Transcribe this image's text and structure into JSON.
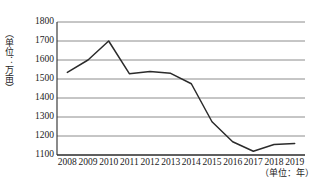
{
  "chart_data": {
    "type": "line",
    "title": "",
    "subtitle": "",
    "xlabel": "（单位：年）",
    "ylabel": "（单位：万亩）",
    "categories": [
      "2008",
      "2009",
      "2010",
      "2011",
      "2012",
      "2013",
      "2014",
      "2015",
      "2016",
      "2017",
      "2018",
      "2019"
    ],
    "x": [
      2008,
      2009,
      2010,
      2011,
      2012,
      2013,
      2014,
      2015,
      2016,
      2017,
      2018,
      2019
    ],
    "values": [
      1535,
      1600,
      1700,
      1528,
      1540,
      1530,
      1475,
      1275,
      1170,
      1120,
      1155,
      1160
    ],
    "series": [
      {
        "name": "面积",
        "values": [
          1535,
          1600,
          1700,
          1528,
          1540,
          1530,
          1475,
          1275,
          1170,
          1120,
          1155,
          1160
        ]
      }
    ],
    "ylim": [
      1100,
      1800
    ],
    "ytick_labels": [
      "1800",
      "1700",
      "1600",
      "1500",
      "1400",
      "1300",
      "1200",
      "1100"
    ],
    "ytick_values": [
      1800,
      1700,
      1600,
      1500,
      1400,
      1300,
      1200,
      1100
    ],
    "ytick_step": 100,
    "grid": true,
    "grid_axis": "y",
    "legend": false,
    "legend_position": "none",
    "line_color": "#2b2b2b",
    "grid_color": "#8c8c8c",
    "axis_color": "#2b2b2b",
    "background_color": "#ffffff",
    "markers": false
  }
}
